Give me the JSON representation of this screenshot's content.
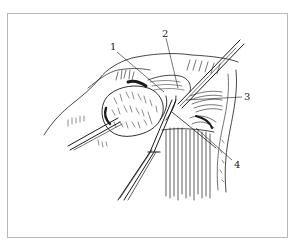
{
  "figure": {
    "type": "surgical-illustration",
    "style": "black-and-white line drawing",
    "colors": {
      "ink": "#1a1a1a",
      "frame": "#b8b8b8",
      "background": "#ffffff"
    },
    "labels": [
      {
        "id": "1",
        "text": "1"
      },
      {
        "id": "2",
        "text": "2"
      },
      {
        "id": "3",
        "text": "3"
      },
      {
        "id": "4",
        "text": "4"
      }
    ]
  }
}
